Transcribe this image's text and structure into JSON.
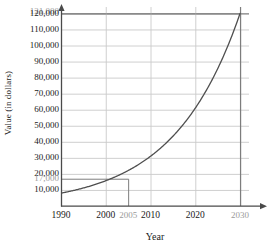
{
  "chart_data": {
    "type": "line",
    "title": "",
    "xlabel": "Year",
    "ylabel": "Value (in dollars)",
    "xlim": [
      1990,
      2032
    ],
    "ylim": [
      0,
      124000
    ],
    "grid": true,
    "legend": false,
    "x_ticks": [
      {
        "value": 1990,
        "label": "1990",
        "style": "normal"
      },
      {
        "value": 2000,
        "label": "2000",
        "style": "normal"
      },
      {
        "value": 2005,
        "label": "2005",
        "style": "annotation"
      },
      {
        "value": 2010,
        "label": "2010",
        "style": "normal"
      },
      {
        "value": 2020,
        "label": "2020",
        "style": "normal"
      },
      {
        "value": 2030,
        "label": "2030",
        "style": "annotation"
      }
    ],
    "y_ticks": [
      {
        "value": 121000,
        "label": "121,000",
        "style": "annotation"
      },
      {
        "value": 120000,
        "label": "120,000",
        "style": "normal"
      },
      {
        "value": 110000,
        "label": "110,000",
        "style": "normal"
      },
      {
        "value": 100000,
        "label": "100,000",
        "style": "normal"
      },
      {
        "value": 90000,
        "label": "90,000",
        "style": "normal"
      },
      {
        "value": 80000,
        "label": "80,000",
        "style": "normal"
      },
      {
        "value": 70000,
        "label": "70,000",
        "style": "normal"
      },
      {
        "value": 60000,
        "label": "60,000",
        "style": "normal"
      },
      {
        "value": 50000,
        "label": "50,000",
        "style": "normal"
      },
      {
        "value": 40000,
        "label": "40,000",
        "style": "normal"
      },
      {
        "value": 30000,
        "label": "30,000",
        "style": "normal"
      },
      {
        "value": 20000,
        "label": "20,000",
        "style": "normal"
      },
      {
        "value": 17000,
        "label": "17,000",
        "style": "annotation"
      },
      {
        "value": 10000,
        "label": "10,000",
        "style": "normal"
      }
    ],
    "x_gridlines": [
      1990,
      2000,
      2010,
      2020,
      2030
    ],
    "series": [
      {
        "name": "Value",
        "x": [
          1990,
          1995,
          2000,
          2005,
          2010,
          2015,
          2020,
          2025,
          2030
        ],
        "values": [
          8000,
          10800,
          13300,
          17000,
          23500,
          35000,
          53000,
          80000,
          120000
        ]
      }
    ],
    "annotations": [
      {
        "name": "2005-value",
        "x": 2005,
        "y": 17000,
        "x_label": "2005",
        "y_label": "17,000"
      },
      {
        "name": "2030-value",
        "x": 2030,
        "y": 120000,
        "x_label": "2030",
        "y_label": "120,000"
      }
    ],
    "colors": {
      "curve": "#4f4f4f",
      "grid": "#c9c9c9",
      "axis": "#4a4a4a",
      "annotation_line": "#7d7d7d",
      "annotation_text": "#9a9a9a",
      "tick_text": "#1a1a1a",
      "background": "#ffffff"
    }
  }
}
